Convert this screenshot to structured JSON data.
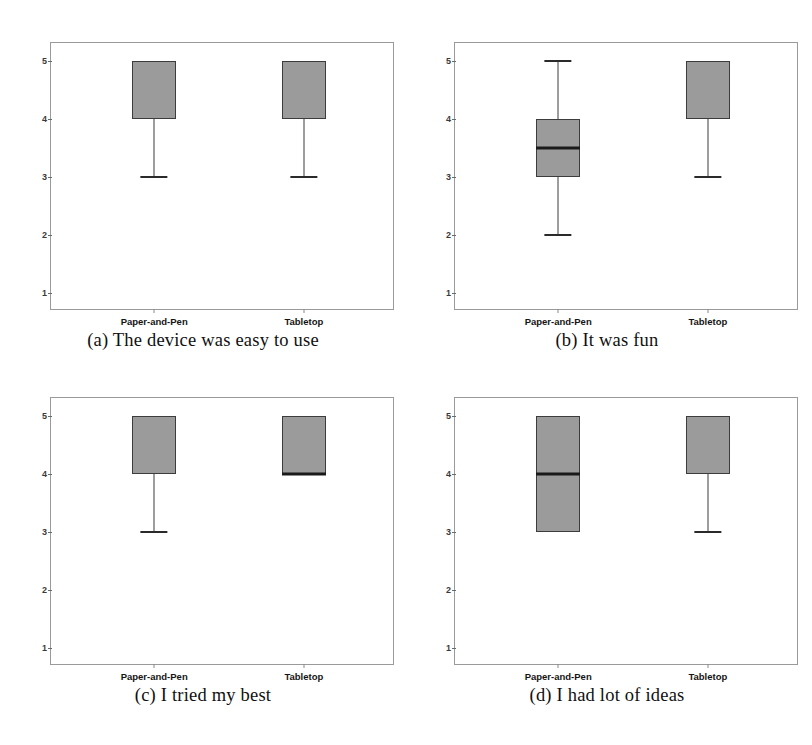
{
  "figure": {
    "panel_labels": [
      "(a)",
      "(b)",
      "(c)",
      "(d)"
    ]
  },
  "chart_data": [
    {
      "type": "box",
      "panel": "a",
      "title": "(a) The device was easy to use",
      "caption": "(a) The device was easy to use",
      "xlabel": "",
      "ylabel": "",
      "ylim": [
        1,
        5
      ],
      "yticks": [
        "5",
        "4",
        "3",
        "2",
        "1"
      ],
      "ytick_values": [
        5,
        4,
        3,
        2,
        1
      ],
      "grid": false,
      "categories": [
        "Paper-and-Pen",
        "Tabletop"
      ],
      "boxes": [
        {
          "category": "Paper-and-Pen",
          "q1": 4,
          "q3": 5,
          "median": 5,
          "whisker_low": 3,
          "whisker_high": 5,
          "median_visible": false,
          "whisker_low_visible": true,
          "whisker_high_visible": false
        },
        {
          "category": "Tabletop",
          "q1": 4,
          "q3": 5,
          "median": 5,
          "whisker_low": 3,
          "whisker_high": 5,
          "median_visible": false,
          "whisker_low_visible": true,
          "whisker_high_visible": false
        }
      ]
    },
    {
      "type": "box",
      "panel": "b",
      "title": "(b) It was fun",
      "caption": "(b) It was fun",
      "xlabel": "",
      "ylabel": "",
      "ylim": [
        1,
        5
      ],
      "yticks": [
        "5",
        "4",
        "3",
        "2",
        "1"
      ],
      "ytick_values": [
        5,
        4,
        3,
        2,
        1
      ],
      "grid": false,
      "categories": [
        "Paper-and-Pen",
        "Tabletop"
      ],
      "boxes": [
        {
          "category": "Paper-and-Pen",
          "q1": 3,
          "q3": 4,
          "median": 3.5,
          "whisker_low": 2,
          "whisker_high": 5,
          "median_visible": true,
          "whisker_low_visible": true,
          "whisker_high_visible": true
        },
        {
          "category": "Tabletop",
          "q1": 4,
          "q3": 5,
          "median": 5,
          "whisker_low": 3,
          "whisker_high": 5,
          "median_visible": false,
          "whisker_low_visible": true,
          "whisker_high_visible": false
        }
      ]
    },
    {
      "type": "box",
      "panel": "c",
      "title": "(c) I tried my best",
      "caption": "(c) I tried my best",
      "xlabel": "",
      "ylabel": "",
      "ylim": [
        1,
        5
      ],
      "yticks": [
        "5",
        "4",
        "3",
        "2",
        "1"
      ],
      "ytick_values": [
        5,
        4,
        3,
        2,
        1
      ],
      "grid": false,
      "categories": [
        "Paper-and-Pen",
        "Tabletop"
      ],
      "boxes": [
        {
          "category": "Paper-and-Pen",
          "q1": 4,
          "q3": 5,
          "median": 5,
          "whisker_low": 3,
          "whisker_high": 5,
          "median_visible": false,
          "whisker_low_visible": true,
          "whisker_high_visible": false
        },
        {
          "category": "Tabletop",
          "q1": 4,
          "q3": 5,
          "median": 4,
          "whisker_low": 4,
          "whisker_high": 5,
          "median_visible": true,
          "whisker_low_visible": false,
          "whisker_high_visible": false
        }
      ]
    },
    {
      "type": "box",
      "panel": "d",
      "title": "(d) I had lot of ideas",
      "caption": "(d) I had lot of ideas",
      "xlabel": "",
      "ylabel": "",
      "ylim": [
        1,
        5
      ],
      "yticks": [
        "5",
        "4",
        "3",
        "2",
        "1"
      ],
      "ytick_values": [
        5,
        4,
        3,
        2,
        1
      ],
      "grid": false,
      "categories": [
        "Paper-and-Pen",
        "Tabletop"
      ],
      "boxes": [
        {
          "category": "Paper-and-Pen",
          "q1": 3,
          "q3": 5,
          "median": 4,
          "whisker_low": 3,
          "whisker_high": 5,
          "median_visible": true,
          "whisker_low_visible": false,
          "whisker_high_visible": false
        },
        {
          "category": "Tabletop",
          "q1": 4,
          "q3": 5,
          "median": 5,
          "whisker_low": 3,
          "whisker_high": 5,
          "median_visible": false,
          "whisker_low_visible": true,
          "whisker_high_visible": false
        }
      ]
    }
  ],
  "style": {
    "box_fill": "#9b9b9b",
    "box_stroke": "#3c3c3c",
    "median_color": "#1a1a1a",
    "frame_color": "#9a9a9a",
    "text_color": "#101010"
  }
}
